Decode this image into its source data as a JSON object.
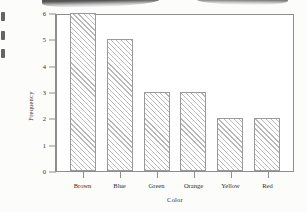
{
  "chart_data": {
    "type": "bar",
    "title": "",
    "subtitle": "",
    "xlabel": "Color",
    "ylabel": "Frequency",
    "categories": [
      "Brown",
      "Blue",
      "Green",
      "Orange",
      "Yellow",
      "Red"
    ],
    "values": [
      6,
      5,
      3,
      3,
      2,
      2
    ],
    "ylim": [
      0,
      6
    ],
    "yticks": [
      0,
      1,
      2,
      3,
      4,
      5,
      6
    ],
    "ytick_labels": [
      "0",
      "1",
      "2",
      "3",
      "4",
      "5",
      "6"
    ],
    "grid": false,
    "legend": null,
    "legend_position": "none",
    "bar_fill": "#ffffff",
    "bar_hatch": "diagonal-45",
    "bar_hatch_color": "#b9b9b9",
    "bar_edge_color": "#9a9a9a",
    "frame_color": "#8e8e8e",
    "annotations": []
  },
  "page": {
    "background": "#fcfcfb",
    "artifacts": {
      "top_smudge_left": "scan-smudge",
      "top_smudge_right": "scan-smudge",
      "left_edge_marks": "scan-edge-marks"
    }
  }
}
